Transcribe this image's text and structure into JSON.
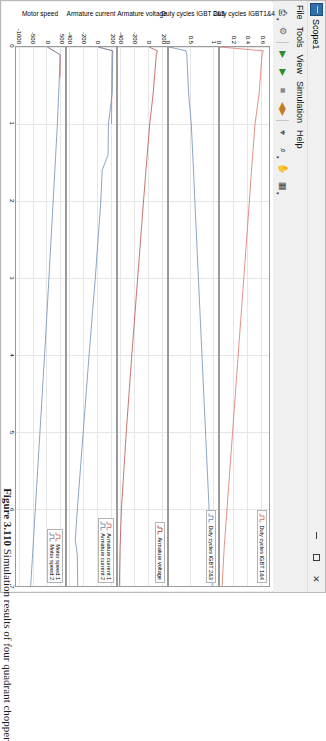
{
  "window": {
    "title": "Scope1",
    "icon_name": "scope-icon",
    "controls": {
      "minimize": "–",
      "maximize": "□",
      "close": "✕"
    }
  },
  "menu": {
    "items": [
      {
        "label": "File"
      },
      {
        "label": "Tools"
      },
      {
        "label": "View"
      },
      {
        "label": "Simulation"
      },
      {
        "label": "Help"
      }
    ]
  },
  "toolbar": {
    "buttons": [
      {
        "name": "print-button",
        "glyph": "⎙",
        "color": "#555555",
        "caret": true
      },
      {
        "name": "configuration-properties-button",
        "glyph": "⚙",
        "color": "#6b6b6b",
        "caret": false
      },
      {
        "name": "run-button",
        "glyph": "▶",
        "color": "#2e8b2e",
        "caret": false
      },
      {
        "name": "step-forward-button",
        "glyph": "▶",
        "color": "#2e8b2e",
        "caret": false
      },
      {
        "name": "stop-button",
        "glyph": "■",
        "color": "#8a8a8a",
        "caret": false
      },
      {
        "name": "simulation-stepping-button",
        "glyph": "◀▶",
        "color": "#c87a1e",
        "caret": false
      },
      {
        "name": "cursor-measurements-button",
        "glyph": "⌖",
        "color": "#4a4a4a",
        "caret": false
      },
      {
        "name": "zoom-in-button",
        "glyph": "⌕",
        "color": "#4a4a4a",
        "caret": true
      },
      {
        "name": "pan-button",
        "glyph": "✋",
        "color": "#4a4a4a",
        "caret": false
      },
      {
        "name": "legend-toggle-button",
        "glyph": "▦",
        "color": "#4a4a4a",
        "caret": true
      }
    ]
  },
  "caption": {
    "figure_number": "Figure 3.110",
    "text": "Simulation results of four quadrant chopper"
  },
  "chart_data": [
    {
      "type": "line",
      "title": "Duty cycles IGBT1&4",
      "xlabel": "",
      "ylabel": "Duty cycles IGBT1&4",
      "xlim": [
        0,
        7
      ],
      "ylim": [
        0,
        0.7
      ],
      "yticks": [
        0.6,
        0.4,
        0.2,
        0
      ],
      "ytick_labels": [
        "0.6",
        "0.4",
        "0.2",
        "0"
      ],
      "grid": true,
      "legend": {
        "position": "top-right",
        "entries": [
          "Duty cycles IGBT 1&4"
        ]
      },
      "series": [
        {
          "name": "Duty cycles IGBT 1&4",
          "color": "#d9776a",
          "x": [
            0,
            0.05,
            0.1,
            0.6,
            1.0,
            1.6,
            2.0,
            3.0,
            4.0,
            5.0,
            6.0,
            6.5,
            7.0
          ],
          "values": [
            0.0,
            0.62,
            0.6,
            0.56,
            0.5,
            0.45,
            0.42,
            0.34,
            0.26,
            0.18,
            0.1,
            0.06,
            0.03
          ]
        }
      ]
    },
    {
      "type": "line",
      "title": "Duty cycles IGBT 2&3",
      "xlabel": "",
      "ylabel": "Duty cycles IGBT 2&3",
      "xlim": [
        0,
        7
      ],
      "ylim": [
        0,
        1.1
      ],
      "yticks": [
        1,
        0.5,
        0
      ],
      "ytick_labels": [
        "1",
        "0.5",
        "0"
      ],
      "grid": true,
      "legend": {
        "position": "top-right",
        "entries": [
          "Duty cycles IGBT 2&3"
        ]
      },
      "series": [
        {
          "name": "Duty cycles IGBT 2&3",
          "color": "#6f8fb5",
          "x": [
            0,
            0.05,
            0.1,
            0.6,
            1.0,
            1.6,
            2.0,
            3.0,
            4.0,
            5.0,
            6.0,
            6.5,
            7.0
          ],
          "values": [
            0.0,
            0.38,
            0.4,
            0.44,
            0.5,
            0.55,
            0.58,
            0.66,
            0.74,
            0.82,
            0.9,
            0.94,
            0.97
          ]
        }
      ]
    },
    {
      "type": "line",
      "title": "Armature voltage",
      "xlabel": "",
      "ylabel": "Armature voltage",
      "xlim": [
        0,
        7
      ],
      "ylim": [
        -450,
        260
      ],
      "yticks": [
        200,
        0,
        -200,
        -400
      ],
      "ytick_labels": [
        "200",
        "0",
        "-200",
        "-400"
      ],
      "grid": true,
      "legend": {
        "position": "top-right",
        "entries": [
          "Armature voltage"
        ]
      },
      "series": [
        {
          "name": "Armature voltage",
          "color": "#b5544b",
          "x": [
            0,
            0.05,
            0.1,
            0.6,
            1.0,
            1.6,
            2.0,
            3.0,
            4.0,
            5.0,
            6.0,
            6.5,
            7.0
          ],
          "values": [
            0,
            120,
            105,
            60,
            10,
            -45,
            -80,
            -165,
            -250,
            -330,
            -400,
            -420,
            -430
          ]
        }
      ]
    },
    {
      "type": "line",
      "title": "Armature current",
      "xlabel": "",
      "ylabel": "Armature current",
      "xlim": [
        0,
        7
      ],
      "ylim": [
        -450,
        260
      ],
      "yticks": [
        200,
        0,
        -200,
        -400
      ],
      "ytick_labels": [
        "200",
        "0",
        "-200",
        "-400"
      ],
      "grid": true,
      "legend": {
        "position": "top-right",
        "entries": [
          "Armature current:1",
          "Armature current:2"
        ]
      },
      "series": [
        {
          "name": "Armature current:1",
          "color": "#d9776a",
          "x": [
            0,
            0.05,
            0.1,
            0.3,
            0.6,
            1.0
          ],
          "values": [
            0,
            210,
            205,
            200,
            198,
            195
          ]
        },
        {
          "name": "Armature current:2",
          "color": "#6f8fb5",
          "x": [
            0,
            0.05,
            0.1,
            0.6,
            1.0,
            1.4,
            1.6,
            2.0,
            3.0,
            4.0,
            5.0,
            6.0,
            6.4,
            6.6,
            7.0
          ],
          "values": [
            0,
            215,
            212,
            205,
            150,
            145,
            60,
            40,
            -40,
            -130,
            -215,
            -300,
            -330,
            -300,
            -295
          ]
        }
      ]
    },
    {
      "type": "line",
      "title": "Motor speed",
      "xlabel": "",
      "ylabel": "Motor speed",
      "xlim": [
        0,
        7
      ],
      "ylim": [
        -1150,
        650
      ],
      "yticks": [
        500,
        0,
        -500,
        -1000
      ],
      "ytick_labels": [
        "500",
        "0",
        "-500",
        "-1000"
      ],
      "grid": true,
      "legend": {
        "position": "top-right",
        "entries": [
          "Motor speed:1",
          "Motor speed:2"
        ]
      },
      "series": [
        {
          "name": "Motor speed:1",
          "color": "#d9776a",
          "x": [
            0,
            0.1,
            0.4
          ],
          "values": [
            0,
            480,
            470
          ]
        },
        {
          "name": "Motor speed:2",
          "color": "#6f8fb5",
          "x": [
            0,
            0.1,
            0.5,
            1.0,
            2.0,
            3.0,
            4.0,
            5.0,
            6.0,
            7.0
          ],
          "values": [
            0,
            470,
            430,
            370,
            215,
            60,
            -100,
            -270,
            -440,
            -610
          ]
        }
      ]
    }
  ],
  "xaxis": {
    "ticks": [
      0,
      1,
      2,
      3,
      4,
      5,
      6,
      7
    ],
    "tick_labels": [
      "0",
      "1",
      "2",
      "3",
      "4",
      "5",
      "6",
      "7"
    ]
  }
}
